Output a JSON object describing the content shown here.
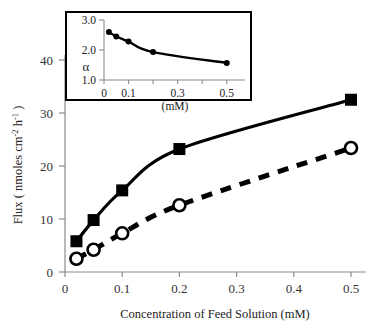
{
  "figure": {
    "background_color": "#ffffff",
    "line_color": "#000000",
    "axis_color": "#8c8c8c",
    "inset_border_color": "#000000"
  },
  "chart_data": [
    {
      "id": "main",
      "type": "line",
      "title": "",
      "xlabel": "Concentration of Feed Solution (mM)",
      "ylabel": "Flux ( nmoles cm-2 h-1 )",
      "ylabel_parts": {
        "prefix": "Flux ( nmoles cm",
        "sup1": "-2",
        "middle": " h",
        "sup2": "-1",
        "suffix": " )"
      },
      "xlim": [
        0,
        0.5
      ],
      "ylim": [
        0,
        43
      ],
      "xticks": [
        0,
        0.1,
        0.2,
        0.3,
        0.4,
        0.5
      ],
      "xticklabels": [
        "0",
        "0.1",
        "0.2",
        "0.3",
        "0.4",
        "0.5"
      ],
      "yticks": [
        0,
        10,
        20,
        30,
        40
      ],
      "yticklabels": [
        "0",
        "10",
        "20",
        "30",
        "40"
      ],
      "grid": false,
      "legend": "none",
      "series": [
        {
          "name": "filled-square-solid",
          "marker": "filled-square",
          "linestyle": "solid",
          "color": "#000000",
          "x": [
            0.02,
            0.05,
            0.1,
            0.2,
            0.5
          ],
          "values": [
            5.8,
            9.8,
            15.4,
            23.2,
            32.5
          ]
        },
        {
          "name": "open-circle-dashed",
          "marker": "open-circle",
          "linestyle": "dashed",
          "color": "#000000",
          "x": [
            0.02,
            0.05,
            0.1,
            0.2,
            0.5
          ],
          "values": [
            2.5,
            4.2,
            7.3,
            12.6,
            23.4
          ]
        }
      ]
    },
    {
      "id": "inset",
      "type": "line",
      "title": "",
      "xlabel": "(mM)",
      "ylabel": "α",
      "xlim": [
        0,
        0.55
      ],
      "ylim": [
        1.0,
        3.0
      ],
      "xticks": [
        0,
        0.1,
        0.2,
        0.3,
        0.4,
        0.5
      ],
      "xticklabels": [
        "0",
        "0.1",
        "",
        "0.3",
        "",
        "0.5"
      ],
      "yticks": [
        1.0,
        2.0,
        3.0
      ],
      "yticklabels": [
        "1.0",
        "2.0",
        "3.0"
      ],
      "grid": false,
      "legend": "none",
      "series": [
        {
          "name": "alpha-filled-circle-solid",
          "marker": "filled-circle",
          "linestyle": "solid",
          "color": "#000000",
          "x": [
            0.02,
            0.05,
            0.1,
            0.2,
            0.5
          ],
          "values": [
            2.6,
            2.45,
            2.28,
            1.93,
            1.57
          ]
        }
      ]
    }
  ]
}
